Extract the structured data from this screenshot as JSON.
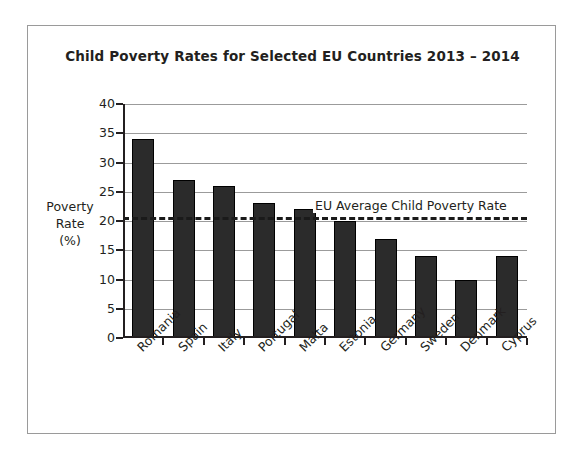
{
  "chart_data": {
    "type": "bar",
    "title": "Child Poverty Rates for Selected EU Countries 2013 – 2014",
    "xlabel": "",
    "ylabel": "Poverty Rate (%)",
    "ylabel_lines": [
      "Poverty",
      "Rate",
      "(%)"
    ],
    "categories": [
      "Romania",
      "Spain",
      "Italy",
      "Portugal",
      "Malta",
      "Estonia",
      "Germany",
      "Sweden",
      "Denmark",
      "Cyprus"
    ],
    "values": [
      34,
      27,
      26,
      23,
      22,
      20,
      17,
      14,
      10,
      14
    ],
    "ylim": [
      0,
      40
    ],
    "ytick_step": 5,
    "yticks": [
      0,
      5,
      10,
      15,
      20,
      25,
      30,
      35,
      40
    ],
    "ytick_labels": [
      "0",
      "5",
      "10",
      "15",
      "20",
      "25",
      "30",
      "35",
      "40"
    ],
    "grid": true,
    "legend": "none",
    "annotations": [
      {
        "name": "eu-average-line",
        "label": "EU Average Child Poverty Rate",
        "value": 20.7,
        "style": "dashed-horizontal-line"
      }
    ],
    "colors": {
      "bar": "#2b2b2b",
      "bar_edge": "#000000",
      "grid": "#9b9b9b",
      "axis": "#231f20",
      "text": "#231f20",
      "background": "#ffffff",
      "frame": "#9a9a9a"
    }
  }
}
